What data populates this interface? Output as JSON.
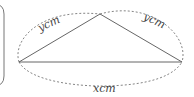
{
  "diagram": {
    "labels": {
      "left_side": "ycm",
      "right_side": "ycm",
      "base": "xcm"
    },
    "colors": {
      "stroke": "#555555",
      "text": "#444444"
    }
  }
}
